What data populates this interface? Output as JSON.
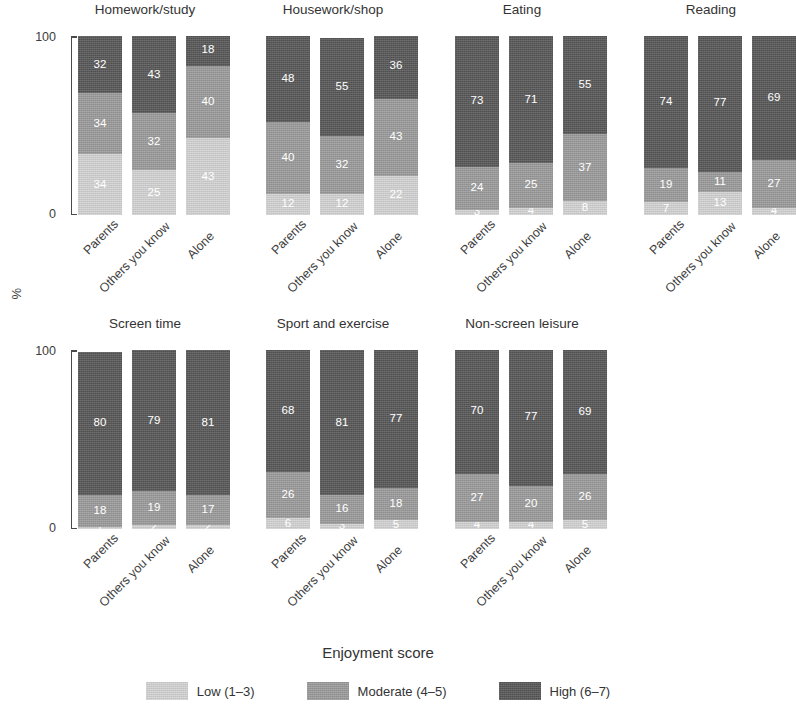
{
  "axis": {
    "ylabel": "%",
    "yticks": [
      "0",
      "100"
    ],
    "ylim": [
      0,
      100
    ],
    "xticklabels": [
      "Parents",
      "Others you know",
      "Alone"
    ]
  },
  "legend": {
    "title": "Enjoyment score",
    "items": [
      {
        "label": "Low (1–3)",
        "color": "#d2d2d2"
      },
      {
        "label": "Moderate (4–5)",
        "color": "#9a9a9a"
      },
      {
        "label": "High (6–7)",
        "color": "#565656"
      }
    ]
  },
  "panels": [
    {
      "title": "Homework/study"
    },
    {
      "title": "Housework/shop"
    },
    {
      "title": "Eating"
    },
    {
      "title": "Reading"
    },
    {
      "title": "Screen time"
    },
    {
      "title": "Sport and exercise"
    },
    {
      "title": "Non-screen leisure"
    }
  ],
  "chart_data": {
    "type": "bar",
    "subtype": "stacked-100-percent",
    "title": "",
    "xlabel": "",
    "ylabel": "%",
    "ylim": [
      0,
      100
    ],
    "yticks": [
      0,
      100
    ],
    "grid": false,
    "legend_position": "bottom",
    "legend_title": "Enjoyment score",
    "categories": [
      "Parents",
      "Others you know",
      "Alone"
    ],
    "series": [
      {
        "name": "Low (1–3)",
        "color": "#d2d2d2"
      },
      {
        "name": "Moderate (4–5)",
        "color": "#9a9a9a"
      },
      {
        "name": "High (6–7)",
        "color": "#565656"
      }
    ],
    "facets": [
      {
        "title": "Homework/study",
        "values": {
          "Low (1–3)": [
            34,
            25,
            43
          ],
          "Moderate (4–5)": [
            34,
            32,
            40
          ],
          "High (6–7)": [
            32,
            43,
            18
          ]
        }
      },
      {
        "title": "Housework/shop",
        "values": {
          "Low (1–3)": [
            12,
            12,
            22
          ],
          "Moderate (4–5)": [
            40,
            32,
            43
          ],
          "High (6–7)": [
            48,
            55,
            36
          ]
        }
      },
      {
        "title": "Eating",
        "values": {
          "Low (1–3)": [
            3,
            4,
            8
          ],
          "Moderate (4–5)": [
            24,
            25,
            37
          ],
          "High (6–7)": [
            73,
            71,
            55
          ]
        }
      },
      {
        "title": "Reading",
        "values": {
          "Low (1–3)": [
            7,
            13,
            4
          ],
          "Moderate (4–5)": [
            19,
            11,
            27
          ],
          "High (6–7)": [
            74,
            77,
            69
          ]
        }
      },
      {
        "title": "Screen time",
        "values": {
          "Low (1–3)": [
            1,
            2,
            2
          ],
          "Moderate (4–5)": [
            18,
            19,
            17
          ],
          "High (6–7)": [
            80,
            79,
            81
          ]
        }
      },
      {
        "title": "Sport and exercise",
        "values": {
          "Low (1–3)": [
            6,
            3,
            5
          ],
          "Moderate (4–5)": [
            26,
            16,
            18
          ],
          "High (6–7)": [
            68,
            81,
            77
          ]
        }
      },
      {
        "title": "Non-screen leisure",
        "values": {
          "Low (1–3)": [
            4,
            4,
            5
          ],
          "Moderate (4–5)": [
            27,
            20,
            26
          ],
          "High (6–7)": [
            70,
            77,
            69
          ]
        }
      }
    ]
  },
  "layout": {
    "row_tops": [
      2,
      316
    ],
    "panel_lefts": [
      60,
      248,
      437,
      626
    ],
    "panel_width": 170,
    "plot_top": 34,
    "plot_height": 179,
    "bar_width": 44,
    "bar_gap": 10,
    "bar_left_offset": 18
  }
}
